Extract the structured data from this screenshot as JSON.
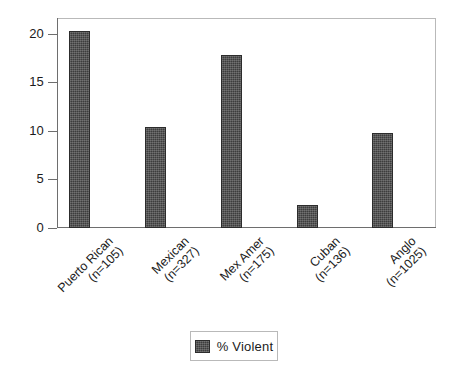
{
  "chart_data": {
    "type": "bar",
    "title": "",
    "subtitle": "",
    "xlabel": "",
    "ylabel": "",
    "categories": [
      "Puerto Rican (n=105)",
      "Mexican (n=327)",
      "Mex Amer (n=175)",
      "Cuban (n=136)",
      "Anglo (n=1025)"
    ],
    "category_lines": [
      [
        "Puerto Rican",
        "(n=105)"
      ],
      [
        "Mexican",
        "(n=327)"
      ],
      [
        "Mex Amer",
        "(n=175)"
      ],
      [
        "Cuban",
        "(n=136)"
      ],
      [
        "Anglo",
        "(n=1025)"
      ]
    ],
    "series": [
      {
        "name": "% Violent",
        "values": [
          20.3,
          10.4,
          17.8,
          2.4,
          9.8
        ]
      }
    ],
    "values": [
      20.3,
      10.4,
      17.8,
      2.4,
      9.8
    ],
    "ylim": [
      0,
      21.6
    ],
    "yticks": [
      0,
      5,
      10,
      15,
      20
    ],
    "ytick_labels": [
      "0",
      "5",
      "10",
      "15",
      "20"
    ],
    "grid": false,
    "legend": {
      "position": "bottom-center",
      "entries": [
        {
          "label": "% Violent",
          "color": "#3d3d3d"
        }
      ]
    },
    "colors": {
      "bar_fill": "#3d3d3d",
      "bar_edge": "#2c2c2c",
      "frame": "#b9b9b9",
      "axis": "#6e6e6e",
      "text": "#1b1b1b",
      "background": "#ffffff"
    },
    "xtick_rotation": -45
  }
}
